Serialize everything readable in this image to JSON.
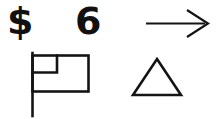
{
  "image": {
    "width": 219,
    "height": 119,
    "background_color": "#ffffff",
    "ink_color": "#141414",
    "description": "Hand-drawn style line sketch of four symbols on a white background"
  },
  "symbols": {
    "dollar_sign": {
      "name": "dollar-sign",
      "text": "$",
      "row": "top",
      "position": "left"
    },
    "digit": {
      "name": "digit-six",
      "text": "6",
      "row": "top",
      "position": "center"
    },
    "arrow": {
      "name": "right-arrow",
      "direction": "right",
      "head_style": "open-v",
      "row": "top",
      "position": "right"
    },
    "flag": {
      "name": "flag",
      "row": "bottom",
      "position": "left",
      "parts": [
        "outer-rectangle",
        "inner-corner-rectangle",
        "vertical-pole"
      ]
    },
    "triangle": {
      "name": "triangle",
      "row": "bottom",
      "position": "right",
      "fill": "none",
      "sides": 3
    }
  }
}
